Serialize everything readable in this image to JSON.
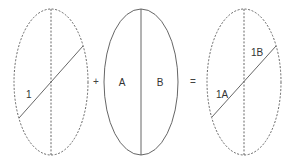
{
  "diagram": {
    "figures": [
      {
        "id": "ellipse-1",
        "style": "dashed",
        "center": [
          51,
          82
        ],
        "radii": [
          37,
          73
        ],
        "divider": "dashed-vertical",
        "diagonal": {
          "from": [
            19,
            118
          ],
          "to": [
            83,
            46
          ]
        },
        "labels": [
          {
            "text": "1",
            "pos": [
              26,
              98
            ]
          }
        ]
      },
      {
        "id": "ellipse-2",
        "style": "solid",
        "center": [
          141,
          82
        ],
        "radii": [
          37,
          73
        ],
        "divider": "solid-vertical",
        "labels": [
          {
            "text": "A",
            "pos": [
              122,
              86
            ]
          },
          {
            "text": "B",
            "pos": [
              160,
              86
            ]
          }
        ]
      },
      {
        "id": "ellipse-3",
        "style": "dashed",
        "center": [
          244,
          82
        ],
        "radii": [
          37,
          73
        ],
        "divider": "dashed-vertical",
        "diagonal": {
          "from": [
            212,
            117
          ],
          "to": [
            276,
            46
          ]
        },
        "labels": [
          {
            "text": "1A",
            "pos": [
              216,
              98
            ]
          },
          {
            "text": "1B",
            "pos": [
              251,
              56
            ]
          }
        ]
      }
    ],
    "operators": [
      {
        "text": "+",
        "pos": [
          96,
          85
        ]
      },
      {
        "text": "=",
        "pos": [
          193,
          85
        ]
      }
    ],
    "colors": {
      "stroke": "#555555",
      "text": "#333333",
      "background": "#ffffff"
    }
  }
}
